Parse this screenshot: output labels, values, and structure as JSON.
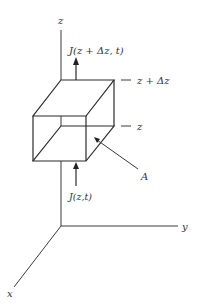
{
  "diagram": {
    "type": "flux-through-volume-element",
    "axes": {
      "z_label": "z",
      "y_label": "y",
      "x_label": "x"
    },
    "flux_top": {
      "label": "J(z + Δz, t)"
    },
    "flux_bottom": {
      "label": "J(z,t)"
    },
    "levels": {
      "upper": "z + Δz",
      "lower": "z"
    },
    "area": {
      "label": "A"
    },
    "colors": {
      "ink": "#2a2a2a",
      "background": "#ffffff"
    }
  }
}
